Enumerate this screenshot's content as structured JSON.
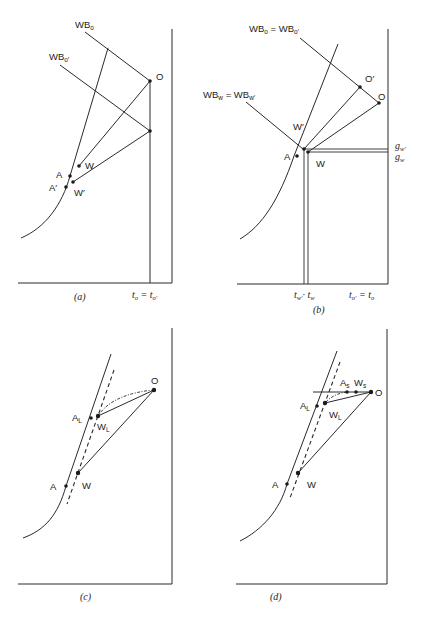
{
  "panels": [
    {
      "id": "a",
      "caption": "(a)",
      "labels": {
        "wb_o": "WB",
        "wb_o_sub": "o",
        "wb_o_prime": "WB",
        "wb_o_prime_sub": "o′",
        "O": "O",
        "W": "W",
        "W_prime": "W′",
        "A": "A",
        "A_prime": "A′",
        "t_axis": "t",
        "t_axis_sub1": "o",
        "t_axis_eq": " = t",
        "t_axis_sub2": "o′"
      }
    },
    {
      "id": "b",
      "caption": "(b)",
      "labels": {
        "wb_o_eq": "WB",
        "wb_o_eq_sub1": "o",
        "wb_o_eq_mid": " = WB",
        "wb_o_eq_sub2": "o′",
        "wb_w_eq": "WB",
        "wb_w_eq_sub1": "w",
        "wb_w_eq_mid": " = WB",
        "wb_w_eq_sub2": "w′",
        "O_prime": "O′",
        "O": "O",
        "W_prime": "W′",
        "W": "W",
        "A": "A",
        "g_w_prime": "g",
        "g_w_prime_sub": "w′",
        "g_w": "g",
        "g_w_sub": "w",
        "t_w": "t",
        "t_w_sub1": "w′",
        "t_w_sep": "· t",
        "t_w_sub2": "w",
        "t_o": "t",
        "t_o_sub1": "o′",
        "t_o_eq": " = t",
        "t_o_sub2": "o"
      }
    },
    {
      "id": "c",
      "caption": "(c)",
      "labels": {
        "O": "O",
        "A_L": "A",
        "A_L_sub": "L",
        "W_L": "W",
        "W_L_sub": "L",
        "A": "A",
        "W": "W"
      }
    },
    {
      "id": "d",
      "caption": "(d)",
      "labels": {
        "A_s": "A",
        "A_s_sub": "s",
        "W_s": "W",
        "W_s_sub": "s",
        "O": "O",
        "A_L": "A",
        "A_L_sub": "L",
        "W_L": "W",
        "W_L_sub": "L",
        "A": "A",
        "W": "W"
      }
    }
  ],
  "colors": {
    "line": "#2a2a2a",
    "point": "#1a1a1a",
    "background": "#ffffff"
  }
}
